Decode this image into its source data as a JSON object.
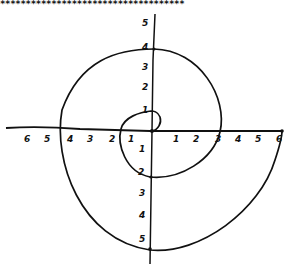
{
  "header": {
    "stars": "************************************"
  },
  "diagram": {
    "type": "hand-drawn spiral on coordinate axes",
    "stroke_color": "#111111",
    "background_color": "#ffffff",
    "x_axis": {
      "negative_labels": [
        "6",
        "5",
        "4",
        "3",
        "2",
        "1"
      ],
      "positive_labels": [
        "1",
        "2",
        "3",
        "4",
        "5",
        "6"
      ]
    },
    "y_axis": {
      "positive_labels": [
        "5",
        "4",
        "3",
        "2",
        "1"
      ],
      "negative_labels": [
        "1",
        "2",
        "3",
        "4",
        "5"
      ]
    },
    "spiral_axis_crossings": [
      {
        "x": 0,
        "y": 0
      },
      {
        "x": 0,
        "y": 1
      },
      {
        "x": -1.5,
        "y": 0
      },
      {
        "x": 0,
        "y": -2
      },
      {
        "x": 3,
        "y": 0
      },
      {
        "x": 0,
        "y": 4
      },
      {
        "x": -4.5,
        "y": 0
      },
      {
        "x": 0,
        "y": -5
      },
      {
        "x": 6,
        "y": 0
      }
    ]
  }
}
